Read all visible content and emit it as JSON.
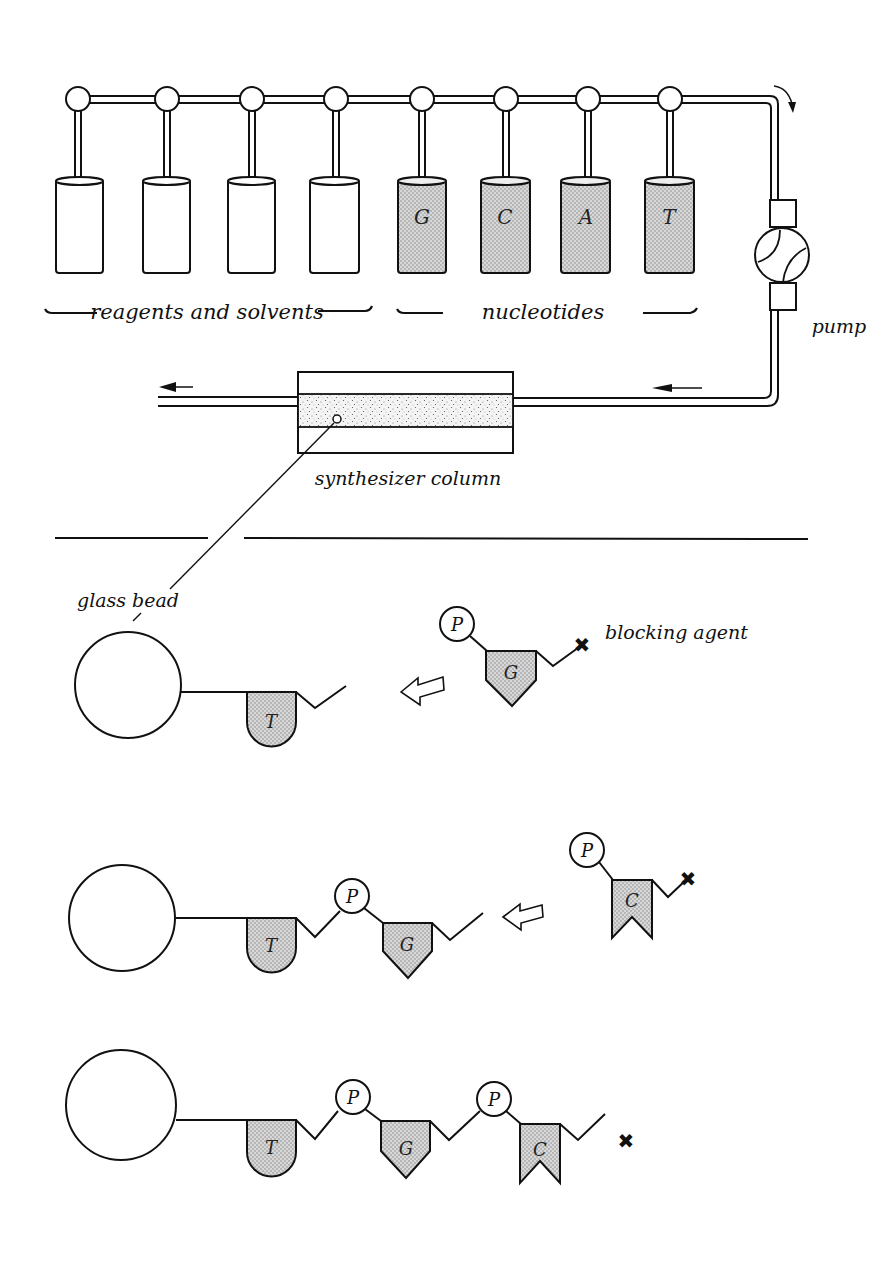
{
  "figure": {
    "colors": {
      "ink": "#111111",
      "nucleotide_fill": "#cfcfcf",
      "background": "#ffffff"
    }
  },
  "apparatus": {
    "reservoirs": [
      {
        "group": "reagents",
        "label": ""
      },
      {
        "group": "reagents",
        "label": ""
      },
      {
        "group": "reagents",
        "label": ""
      },
      {
        "group": "reagents",
        "label": ""
      },
      {
        "group": "nucleotides",
        "label": "G"
      },
      {
        "group": "nucleotides",
        "label": "C"
      },
      {
        "group": "nucleotides",
        "label": "A"
      },
      {
        "group": "nucleotides",
        "label": "T"
      }
    ],
    "group_labels": {
      "reagents": "reagents and solvents",
      "nucleotides": "nucleotides"
    },
    "pump_label": "pump",
    "column_label": "synthesizer column"
  },
  "synthesis": {
    "bead_label": "glass bead",
    "blocking_label": "blocking agent",
    "phosphate_label": "P",
    "steps": [
      {
        "chain": [
          "T"
        ],
        "incoming": "G"
      },
      {
        "chain": [
          "T",
          "G"
        ],
        "incoming": "C"
      },
      {
        "chain": [
          "T",
          "G",
          "C"
        ],
        "incoming": null
      }
    ]
  }
}
